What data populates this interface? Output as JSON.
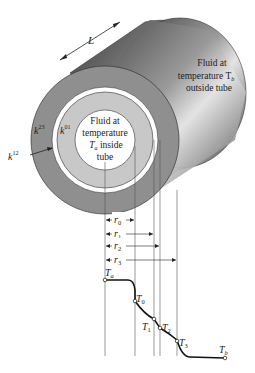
{
  "diagram": {
    "length_label": "L",
    "outside_fluid": {
      "line1": "Fluid at",
      "line2": "temperature T",
      "line2_sub": "b",
      "line3": "outside tube"
    },
    "inside_fluid": {
      "line1": "Fluid at",
      "line2": "temperature",
      "line3_var": "T",
      "line3_sub": "a",
      "line3_rest": " inside",
      "line4": "tube"
    },
    "conductivities": [
      {
        "base": "k",
        "sup": "23"
      },
      {
        "base": "k",
        "sup": "01"
      },
      {
        "base": "k",
        "sup": "12"
      }
    ],
    "radii": [
      {
        "base": "r",
        "sub": "0"
      },
      {
        "base": "r",
        "sub": "1"
      },
      {
        "base": "r",
        "sub": "2"
      },
      {
        "base": "r",
        "sub": "3"
      }
    ],
    "temperatures": [
      {
        "base": "T",
        "sub": "a"
      },
      {
        "base": "T",
        "sub": "0"
      },
      {
        "base": "T",
        "sub": "1"
      },
      {
        "base": "T",
        "sub": "2"
      },
      {
        "base": "T",
        "sub": "3"
      },
      {
        "base": "T",
        "sub": "b"
      }
    ],
    "colors": {
      "outer_layer": "#8f8f8f",
      "gap_layer": "#ffffff",
      "middle_layer": "#c8c8c8",
      "inner_core": "#ffffff",
      "cylinder_body": "#6a6a6a"
    }
  }
}
